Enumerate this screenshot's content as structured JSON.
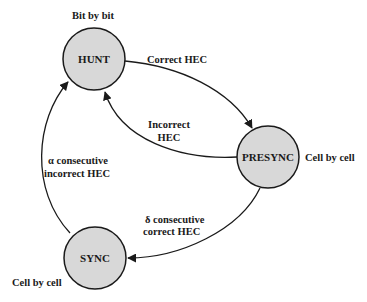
{
  "diagram": {
    "type": "state-machine",
    "colors": {
      "node_fill": "#d8d8d8",
      "stroke": "#1a1a1a",
      "background": "#ffffff"
    },
    "states": [
      {
        "id": "hunt",
        "label": "HUNT",
        "annotation": "Bit by bit"
      },
      {
        "id": "presync",
        "label": "PRESYNC",
        "annotation": "Cell by cell"
      },
      {
        "id": "sync",
        "label": "SYNC",
        "annotation": "Cell by cell"
      }
    ],
    "transitions": [
      {
        "from": "hunt",
        "to": "presync",
        "label_lines": [
          "Correct HEC"
        ]
      },
      {
        "from": "presync",
        "to": "hunt",
        "label_lines": [
          "Incorrect",
          "HEC"
        ]
      },
      {
        "from": "presync",
        "to": "sync",
        "label_lines": [
          "δ consecutive",
          "correct HEC"
        ]
      },
      {
        "from": "sync",
        "to": "hunt",
        "label_lines": [
          "α consecutive",
          "incorrect HEC"
        ]
      }
    ]
  }
}
